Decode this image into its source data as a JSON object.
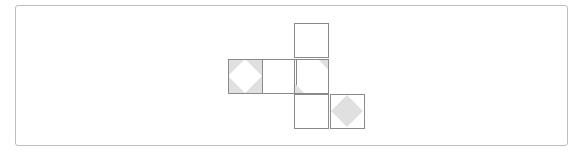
{
  "diagram": {
    "type": "cube-net",
    "frame": {
      "x": 15,
      "y": 5,
      "width": 553,
      "height": 141,
      "border_color": "#bdbdbd"
    },
    "colors": {
      "line": "#8a8a8a",
      "fill": "#e0e0e0",
      "background": "#ffffff"
    },
    "cell_size": 34,
    "faces": [
      {
        "id": "top",
        "x": 294,
        "y": 23,
        "pattern": "blank"
      },
      {
        "id": "row-left",
        "x": 228,
        "y": 59,
        "pattern": "white-diamond-on-gray-corners"
      },
      {
        "id": "row-middle",
        "x": 262,
        "y": 59,
        "pattern": "blank"
      },
      {
        "id": "center",
        "x": 294,
        "y": 59,
        "pattern": "corner-triangles-top-right-bottom-left"
      },
      {
        "id": "bottom",
        "x": 294,
        "y": 94,
        "pattern": "blank"
      },
      {
        "id": "bottom-right",
        "x": 330,
        "y": 94,
        "pattern": "gray-diamond"
      }
    ]
  }
}
